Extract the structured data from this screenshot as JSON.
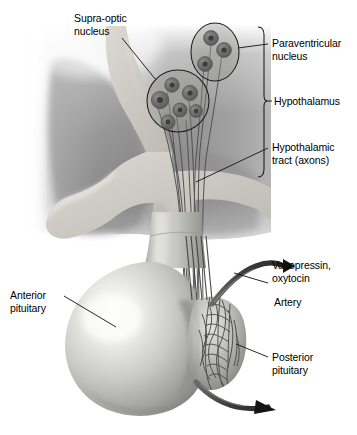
{
  "figure": {
    "type": "anatomical-illustration",
    "style": "grayscale airbrush medical illustration",
    "width": 357,
    "height": 435
  },
  "labels": {
    "supraoptic_nucleus": "Supra-optic\nnucleus",
    "paraventricular_nucleus": "Paraventricular\nnucleus",
    "hypothalamus": "Hypothalamus",
    "hypothalamic_tract": "Hypothalamic\ntract (axons)",
    "vasopressin_oxytocin": "Vasopressin,\noxytocin",
    "artery": "Artery",
    "anterior_pituitary": "Anterior\npituitary",
    "posterior_pituitary": "Posterior\npituitary"
  },
  "structures": {
    "supraoptic_nucleus": {
      "neuron_count": 6,
      "shape": "circle",
      "cx": 178,
      "cy": 101,
      "r": 31
    },
    "paraventricular_nucleus": {
      "neuron_count": 3,
      "shape": "ellipse",
      "cx": 215,
      "cy": 52,
      "rx": 24,
      "ry": 29
    },
    "hypothalamus_bracket": {
      "top": 27,
      "bottom": 177,
      "x": 263,
      "tick_y": 101
    },
    "axon_fibers": 5,
    "capillary_plexus": "posterior pituitary capillary network"
  },
  "colors": {
    "background": "#ffffff",
    "brain_tissue_dark": "#8e8e8e",
    "brain_tissue_mid": "#a5a5a5",
    "ventricle_light": "#cfcfcb",
    "nucleus_circle_fill": "#8a8a8a",
    "neuron_body": "#6e6e6e",
    "neuron_core": "#4a4a4a",
    "gland_light": "#e8e8e6",
    "gland_mid": "#b9b9b6",
    "gland_dark": "#7c7c7a",
    "vessel": "#4b4b4b",
    "leader_line": "#1a1a1a",
    "text": "#000000"
  }
}
